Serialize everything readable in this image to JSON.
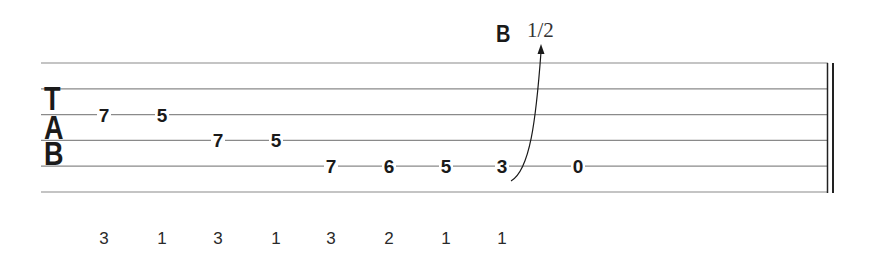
{
  "notation": {
    "clef": [
      "T",
      "A",
      "B"
    ],
    "strings": 6,
    "technique": {
      "label": "B",
      "amount": "1/2",
      "meaning": "bend",
      "on_note_index": 7
    },
    "notes": [
      {
        "fret": "7",
        "string": 3,
        "finger": "3"
      },
      {
        "fret": "5",
        "string": 3,
        "finger": "1"
      },
      {
        "fret": "7",
        "string": 4,
        "finger": "3"
      },
      {
        "fret": "5",
        "string": 4,
        "finger": "1"
      },
      {
        "fret": "7",
        "string": 5,
        "finger": "3"
      },
      {
        "fret": "6",
        "string": 5,
        "finger": "2"
      },
      {
        "fret": "5",
        "string": 5,
        "finger": "1"
      },
      {
        "fret": "3",
        "string": 5,
        "finger": "1"
      },
      {
        "fret": "0",
        "string": 5,
        "finger": ""
      }
    ],
    "ending": "double-barline"
  },
  "colors": {
    "staff": "#8a8a8a",
    "ink": "#1a1a1a"
  }
}
